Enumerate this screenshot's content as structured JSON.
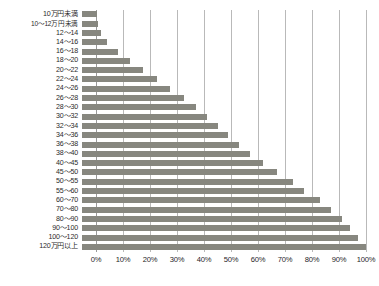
{
  "chart_data": {
    "type": "bar",
    "orientation": "horizontal",
    "title": "",
    "subtitle": "",
    "xlabel": "",
    "ylabel": "",
    "xlim": [
      0,
      100
    ],
    "ylim": null,
    "grid": true,
    "legend": null,
    "x_tick_labels": [
      "0%",
      "10%",
      "20%",
      "30%",
      "40%",
      "50%",
      "60%",
      "70%",
      "80%",
      "90%",
      "100%"
    ],
    "x_tick_values": [
      0,
      10,
      20,
      30,
      40,
      50,
      60,
      70,
      80,
      90,
      100
    ],
    "categories": [
      "10万円未満",
      "10〜12万円未満",
      "12〜14",
      "14〜16",
      "16〜18",
      "18〜20",
      "20〜22",
      "22〜24",
      "24〜26",
      "26〜28",
      "28〜30",
      "30〜32",
      "32〜34",
      "34〜36",
      "36〜38",
      "38〜40",
      "40〜45",
      "45〜50",
      "50〜55",
      "55〜60",
      "60〜70",
      "70〜80",
      "80〜90",
      "90〜100",
      "100〜120",
      "120万円以上"
    ],
    "values": [
      0.3,
      0.6,
      2.0,
      4.0,
      8.0,
      12.5,
      17.5,
      22.5,
      27.5,
      32.5,
      37.0,
      41.0,
      45.0,
      49.0,
      53.0,
      57.0,
      62.0,
      67.0,
      73.0,
      77.0,
      83.0,
      87.0,
      91.0,
      94.0,
      97.0,
      100.0
    ],
    "bar_color": "#87877f",
    "gridline_color": "#b9b9b9",
    "axis_color": "#9a9a9a"
  }
}
